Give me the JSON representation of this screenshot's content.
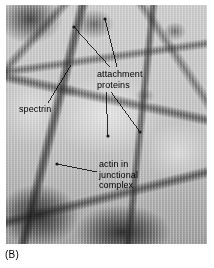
{
  "figure": {
    "caption": "(B)",
    "panel_letter": "B",
    "kind": "electron-micrograph"
  },
  "micrograph": {
    "alt": "grayscale electron micrograph of a polygonal spectrin network with dark junctional nodes",
    "background_color": "#c4c4c4",
    "filament_color": "#232323",
    "highlight_color": "#ffffff"
  },
  "labels": [
    {
      "id": "attachment-proteins",
      "text": "attachment\nproteins",
      "lines": [
        "attachment",
        "proteins"
      ],
      "x": 97,
      "y": 69,
      "color": "#000000"
    },
    {
      "id": "spectrin",
      "text": "spectrin",
      "lines": [
        "spectrin"
      ],
      "x": 19,
      "y": 104,
      "color": "#000000"
    },
    {
      "id": "actin-in-junctional-complex",
      "text": "actin in\njunctional\ncomplex",
      "lines": [
        "actin in",
        "junctional",
        "complex"
      ],
      "x": 99,
      "y": 159,
      "color": "#000000"
    }
  ],
  "leader_lines": [
    {
      "id": "leader-attachment-upper-left",
      "x1": 110,
      "y1": 67,
      "x2": 74,
      "y2": 27,
      "stroke": "#000000"
    },
    {
      "id": "leader-attachment-upper-right",
      "x1": 117,
      "y1": 67,
      "x2": 105,
      "y2": 19,
      "stroke": "#000000"
    },
    {
      "id": "leader-attachment-lower-left",
      "x1": 106,
      "y1": 92,
      "x2": 108,
      "y2": 136,
      "stroke": "#000000"
    },
    {
      "id": "leader-attachment-lower-right",
      "x1": 111,
      "y1": 92,
      "x2": 140,
      "y2": 132,
      "stroke": "#000000"
    },
    {
      "id": "leader-spectrin",
      "x1": 48,
      "y1": 103,
      "x2": 71,
      "y2": 65,
      "stroke": "#000000"
    },
    {
      "id": "leader-actin",
      "x1": 97,
      "y1": 172,
      "x2": 57,
      "y2": 164,
      "stroke": "#000000"
    }
  ],
  "nodes": [
    {
      "id": "junction-node-upper-left",
      "cx": 74,
      "cy": 27
    },
    {
      "id": "junction-node-upper-right",
      "cx": 105,
      "cy": 19
    },
    {
      "id": "junction-node-mid-left",
      "cx": 108,
      "cy": 136
    },
    {
      "id": "junction-node-mid-right",
      "cx": 140,
      "cy": 132
    },
    {
      "id": "junction-node-actin",
      "cx": 57,
      "cy": 164
    }
  ]
}
